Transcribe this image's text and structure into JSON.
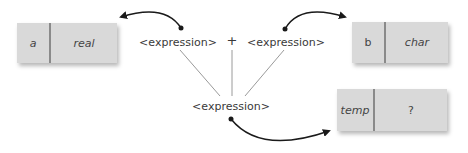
{
  "diagram": {
    "boxes": [
      {
        "name": "a",
        "type": "real"
      },
      {
        "name": "b",
        "type": "char"
      },
      {
        "name": "temp",
        "type": "?"
      }
    ],
    "expressions": {
      "left": "<expression>",
      "operator": "+",
      "right": "<expression>",
      "result": "<expression>"
    },
    "colors": {
      "box_fill": "#d9d9d9",
      "divider": "#8a8a8a",
      "connector": "#9a9a9a",
      "arrow": "#1a1a1a"
    }
  }
}
